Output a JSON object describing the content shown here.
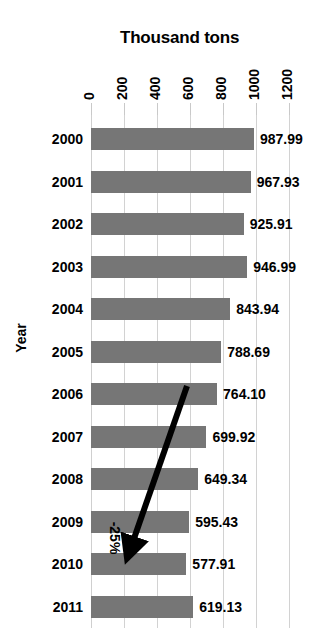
{
  "chart_data": {
    "type": "bar",
    "orientation": "horizontal",
    "title": "Thousand tons",
    "xlabel": "Thousand tons",
    "ylabel": "Year",
    "categories": [
      "2000",
      "2001",
      "2002",
      "2003",
      "2004",
      "2005",
      "2006",
      "2007",
      "2008",
      "2009",
      "2010",
      "2011"
    ],
    "values": [
      987.99,
      967.93,
      925.91,
      946.99,
      843.94,
      788.69,
      764.1,
      699.92,
      649.34,
      595.43,
      577.91,
      619.13
    ],
    "value_labels": [
      "987.99",
      "967.93",
      "925.91",
      "946.99",
      "843.94",
      "788.69",
      "764.10",
      "699.92",
      "649.34",
      "595.43",
      "577.91",
      "619.13"
    ],
    "xticks": [
      0,
      200,
      400,
      600,
      800,
      1000,
      1200
    ],
    "xtick_labels": [
      "0",
      "200",
      "400",
      "600",
      "800",
      "1000",
      "1200"
    ],
    "xlim": [
      0,
      1200
    ],
    "grid": true,
    "legend": false,
    "bar_color": "#767676",
    "grid_color": "#d2d2d2",
    "text_color": "#000000",
    "annotations": [
      {
        "text": "-25%",
        "type": "arrow",
        "from_category": "2006",
        "to_category": "2010",
        "note": "arrow drawn from the 2006 bar down-left to the 2010 bar"
      }
    ]
  }
}
